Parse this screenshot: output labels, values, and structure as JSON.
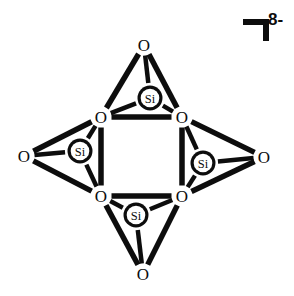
{
  "figure": {
    "background_color": "#ffffff",
    "stroke_color": "#0d0d0d",
    "fill_color": "#ffffff"
  },
  "charge": {
    "value": "8-",
    "bracket_icon": "right-square-bracket-corner"
  },
  "chart_data": {
    "type": "diagram",
    "subtype": "chemical-structure",
    "charge": "8-",
    "silicon_count": 4,
    "oxygen_count": 8,
    "atoms": [
      {
        "id": "si-top",
        "element": "Si",
        "label": "Si",
        "x": 150,
        "y": 98,
        "radius": 12.5,
        "kind": "silicon"
      },
      {
        "id": "si-left",
        "element": "Si",
        "label": "Si",
        "x": 80,
        "y": 151,
        "radius": 12.5,
        "kind": "silicon"
      },
      {
        "id": "si-right",
        "element": "Si",
        "label": "Si",
        "x": 203,
        "y": 163,
        "radius": 12.5,
        "kind": "silicon"
      },
      {
        "id": "si-bottom",
        "element": "Si",
        "label": "Si",
        "x": 136,
        "y": 215,
        "radius": 12.5,
        "kind": "silicon"
      },
      {
        "id": "o-term-top",
        "element": "O",
        "label": "O",
        "x": 144,
        "y": 45,
        "kind": "terminal-oxygen"
      },
      {
        "id": "o-term-left",
        "element": "O",
        "label": "O",
        "x": 24,
        "y": 156,
        "kind": "terminal-oxygen"
      },
      {
        "id": "o-term-right",
        "element": "O",
        "label": "O",
        "x": 264,
        "y": 157,
        "kind": "terminal-oxygen"
      },
      {
        "id": "o-term-bottom",
        "element": "O",
        "label": "O",
        "x": 143,
        "y": 274,
        "kind": "terminal-oxygen"
      },
      {
        "id": "o-bridge-tl",
        "element": "O",
        "label": "O",
        "x": 101,
        "y": 117,
        "kind": "bridging-oxygen"
      },
      {
        "id": "o-bridge-tr",
        "element": "O",
        "label": "O",
        "x": 182,
        "y": 117,
        "kind": "bridging-oxygen"
      },
      {
        "id": "o-bridge-bl",
        "element": "O",
        "label": "O",
        "x": 101,
        "y": 196,
        "kind": "bridging-oxygen"
      },
      {
        "id": "o-bridge-br",
        "element": "O",
        "label": "O",
        "x": 182,
        "y": 196,
        "kind": "bridging-oxygen"
      }
    ],
    "bonds": [
      {
        "from": "si-top",
        "to": "o-term-top",
        "width": 4.5,
        "kind": "si-o"
      },
      {
        "from": "si-top",
        "to": "o-bridge-tl",
        "width": 4.5,
        "kind": "si-o"
      },
      {
        "from": "si-top",
        "to": "o-bridge-tr",
        "width": 4.5,
        "kind": "si-o"
      },
      {
        "from": "si-left",
        "to": "o-term-left",
        "width": 4.5,
        "kind": "si-o"
      },
      {
        "from": "si-left",
        "to": "o-bridge-tl",
        "width": 4.5,
        "kind": "si-o"
      },
      {
        "from": "si-left",
        "to": "o-bridge-bl",
        "width": 4.5,
        "kind": "si-o"
      },
      {
        "from": "si-right",
        "to": "o-term-right",
        "width": 4.5,
        "kind": "si-o"
      },
      {
        "from": "si-right",
        "to": "o-bridge-tr",
        "width": 4.5,
        "kind": "si-o"
      },
      {
        "from": "si-right",
        "to": "o-bridge-br",
        "width": 4.5,
        "kind": "si-o"
      },
      {
        "from": "si-bottom",
        "to": "o-term-bottom",
        "width": 4.5,
        "kind": "si-o"
      },
      {
        "from": "si-bottom",
        "to": "o-bridge-bl",
        "width": 4.5,
        "kind": "si-o"
      },
      {
        "from": "si-bottom",
        "to": "o-bridge-br",
        "width": 4.5,
        "kind": "si-o"
      },
      {
        "from": "o-term-top",
        "to": "o-bridge-tl",
        "width": 5.5,
        "kind": "tetrahedron-edge"
      },
      {
        "from": "o-term-top",
        "to": "o-bridge-tr",
        "width": 5.5,
        "kind": "tetrahedron-edge"
      },
      {
        "from": "o-bridge-tl",
        "to": "o-bridge-tr",
        "width": 5.5,
        "kind": "tetrahedron-edge"
      },
      {
        "from": "o-term-left",
        "to": "o-bridge-tl",
        "width": 5.5,
        "kind": "tetrahedron-edge"
      },
      {
        "from": "o-term-left",
        "to": "o-bridge-bl",
        "width": 5.5,
        "kind": "tetrahedron-edge"
      },
      {
        "from": "o-bridge-tl",
        "to": "o-bridge-bl",
        "width": 5.5,
        "kind": "tetrahedron-edge"
      },
      {
        "from": "o-term-right",
        "to": "o-bridge-tr",
        "width": 5.5,
        "kind": "tetrahedron-edge"
      },
      {
        "from": "o-term-right",
        "to": "o-bridge-br",
        "width": 5.5,
        "kind": "tetrahedron-edge"
      },
      {
        "from": "o-bridge-tr",
        "to": "o-bridge-br",
        "width": 5.5,
        "kind": "tetrahedron-edge"
      },
      {
        "from": "o-term-bottom",
        "to": "o-bridge-bl",
        "width": 5.5,
        "kind": "tetrahedron-edge"
      },
      {
        "from": "o-term-bottom",
        "to": "o-bridge-br",
        "width": 5.5,
        "kind": "tetrahedron-edge"
      },
      {
        "from": "o-bridge-bl",
        "to": "o-bridge-br",
        "width": 5.5,
        "kind": "tetrahedron-edge"
      }
    ]
  }
}
